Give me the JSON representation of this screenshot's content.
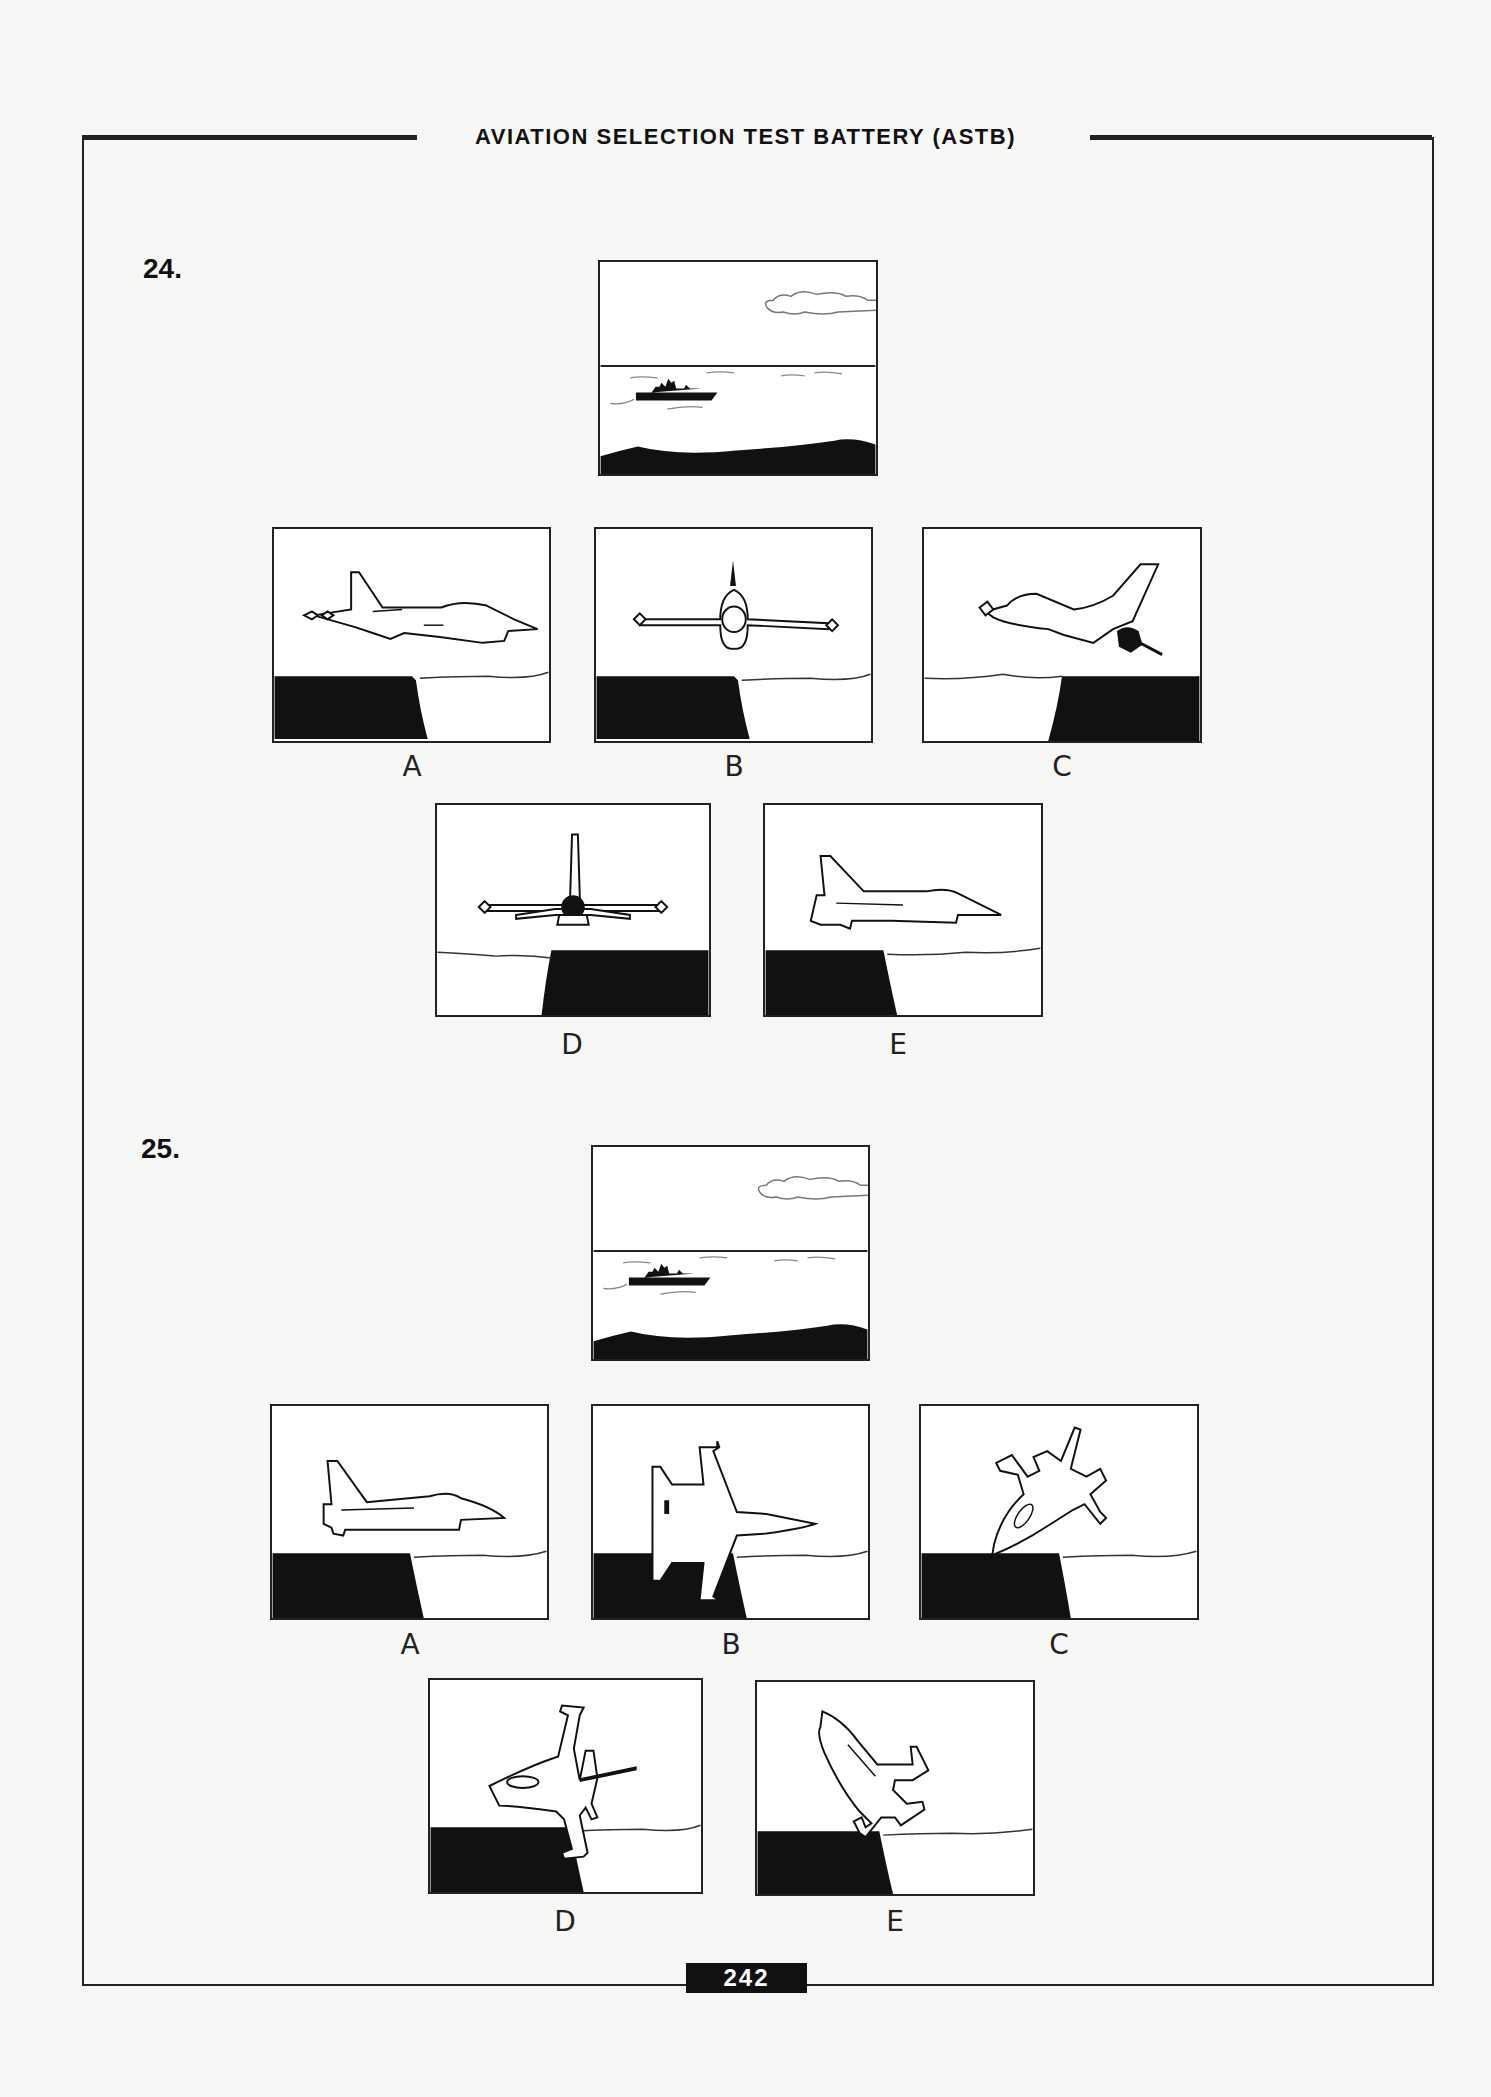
{
  "header": {
    "title": "AVIATION SELECTION TEST BATTERY (ASTB)"
  },
  "questions": [
    {
      "number": "24.",
      "prompt_scene": "ship-on-horizon-with-cloud",
      "options": [
        {
          "label": "A",
          "scene": "jet-side-view-left-facing-right-cliff-left"
        },
        {
          "label": "B",
          "scene": "jet-front-view-cliff-left"
        },
        {
          "label": "C",
          "scene": "jet-banked-side-view-cliff-right"
        },
        {
          "label": "D",
          "scene": "jet-rear-view-cliff-right"
        },
        {
          "label": "E",
          "scene": "jet-side-view-cliff-left"
        }
      ]
    },
    {
      "number": "25.",
      "prompt_scene": "ship-on-horizon-with-cloud",
      "options": [
        {
          "label": "A",
          "scene": "jet-side-view-cliff-left"
        },
        {
          "label": "B",
          "scene": "jet-top-view-cliff-left"
        },
        {
          "label": "C",
          "scene": "jet-diving-top-view-cliff-left"
        },
        {
          "label": "D",
          "scene": "jet-banked-top-view-cliff-left"
        },
        {
          "label": "E",
          "scene": "jet-climbing-top-view-cliff-left"
        }
      ]
    }
  ],
  "footer": {
    "page_number": "242"
  },
  "colors": {
    "ink": "#111111",
    "paper": "#f7f7f5"
  }
}
